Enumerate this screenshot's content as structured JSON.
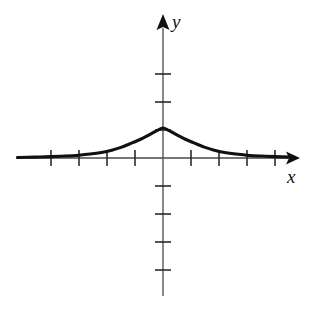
{
  "figure": {
    "width": 311,
    "height": 314,
    "background_color": "#ffffff",
    "axis_color": "#4a4a4a",
    "curve_color": "#111111",
    "tick_color": "#2b2b2b"
  },
  "labels": {
    "y_axis": "y",
    "x_axis": "x"
  },
  "chart_data": {
    "type": "line",
    "title": "",
    "subtitle": "",
    "xlabel": "x",
    "ylabel": "y",
    "grid": false,
    "legend": null,
    "axis_style": "cartesian-arrows",
    "origin_px": [
      163,
      158
    ],
    "unit_px": 28,
    "xlim": [
      -5.2,
      4.7
    ],
    "ylim": [
      -5.0,
      5.0
    ],
    "x_ticks": [
      -4,
      -3,
      -2,
      -1,
      1,
      2,
      3,
      4
    ],
    "y_ticks": [
      -4,
      -3,
      -2,
      -1,
      1,
      2,
      3
    ],
    "x_tick_labels": [
      "",
      "",
      "",
      "",
      "",
      "",
      "",
      ""
    ],
    "y_tick_labels": [
      "",
      "",
      "",
      "",
      "",
      "",
      ""
    ],
    "series": [
      {
        "name": "bell curve",
        "description": "symmetric bell-shaped curve peaking at the y-axis and approaching the x-axis asymptotically on both sides",
        "peak": {
          "x": 0,
          "y": 1.07
        },
        "x": [
          -5.2,
          -4.6,
          -4.0,
          -3.5,
          -3.0,
          -2.6,
          -2.2,
          -1.8,
          -1.5,
          -1.2,
          -1.0,
          -0.8,
          -0.6,
          -0.4,
          -0.2,
          0.0,
          0.2,
          0.4,
          0.6,
          0.8,
          1.0,
          1.2,
          1.5,
          1.8,
          2.2,
          2.6,
          3.0,
          3.5,
          4.0,
          4.6,
          4.7
        ],
        "y": [
          0.02,
          0.03,
          0.05,
          0.07,
          0.1,
          0.14,
          0.2,
          0.29,
          0.38,
          0.5,
          0.58,
          0.67,
          0.77,
          0.88,
          0.99,
          1.07,
          0.99,
          0.88,
          0.77,
          0.67,
          0.58,
          0.5,
          0.38,
          0.29,
          0.2,
          0.14,
          0.1,
          0.07,
          0.05,
          0.03,
          0.02
        ]
      }
    ]
  }
}
